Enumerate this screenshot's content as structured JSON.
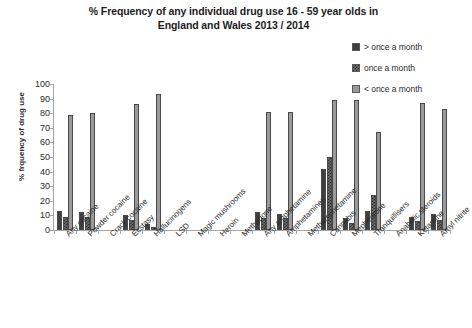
{
  "chart_data": {
    "type": "bar",
    "title": "% Frequency of any individual drug use 16 - 59 year olds in England and Wales 2013 / 2014",
    "title_lines": [
      "% Frequency of any individual drug use 16 - 59 year olds in",
      "England and Wales 2013 / 2014"
    ],
    "xlabel": "",
    "ylabel": "% frquency of drug use",
    "ylim": [
      0,
      100
    ],
    "yticks": [
      0,
      10,
      20,
      30,
      40,
      50,
      60,
      70,
      80,
      90,
      100
    ],
    "grid": false,
    "legend_position": "top-right",
    "categories": [
      "Any cocaine",
      "Powder cocaine",
      "Crack cocaine",
      "Ecstasy",
      "Hallucinogens",
      "LSD",
      "Magic mushrooms",
      "Heroin",
      "Methadone",
      "Any amphetamine",
      "Amphetamines",
      "Methamphetamine",
      "Cannabis",
      "Mephedrone",
      "Tranquillisers",
      "Anabolic steroids",
      "Ketamine",
      "Amyl nitrite"
    ],
    "series": [
      {
        "name": "> once a month",
        "fill": "solid",
        "color": "#3f3f3f",
        "values": [
          13,
          12,
          0,
          10,
          4,
          0,
          0,
          0,
          0,
          12,
          11,
          0,
          42,
          8,
          13,
          0,
          9,
          11
        ]
      },
      {
        "name": "once a month",
        "fill": "checkered",
        "color": "#6f6f6f",
        "values": [
          9,
          9,
          0,
          7,
          2,
          0,
          0,
          0,
          0,
          8,
          8,
          0,
          50,
          5,
          24,
          0,
          6,
          7
        ]
      },
      {
        "name": "< once a month",
        "fill": "light",
        "color": "#9a9a9a",
        "values": [
          79,
          80,
          0,
          86,
          93,
          0,
          0,
          0,
          0,
          81,
          81,
          0,
          89,
          89,
          67,
          0,
          87,
          83
        ]
      }
    ]
  },
  "legend": {
    "items": [
      {
        "label": "> once a month",
        "swatch": "fill-solid"
      },
      {
        "label": "once a month",
        "swatch": "fill-check"
      },
      {
        "label": "< once a month",
        "swatch": "fill-light"
      }
    ]
  }
}
